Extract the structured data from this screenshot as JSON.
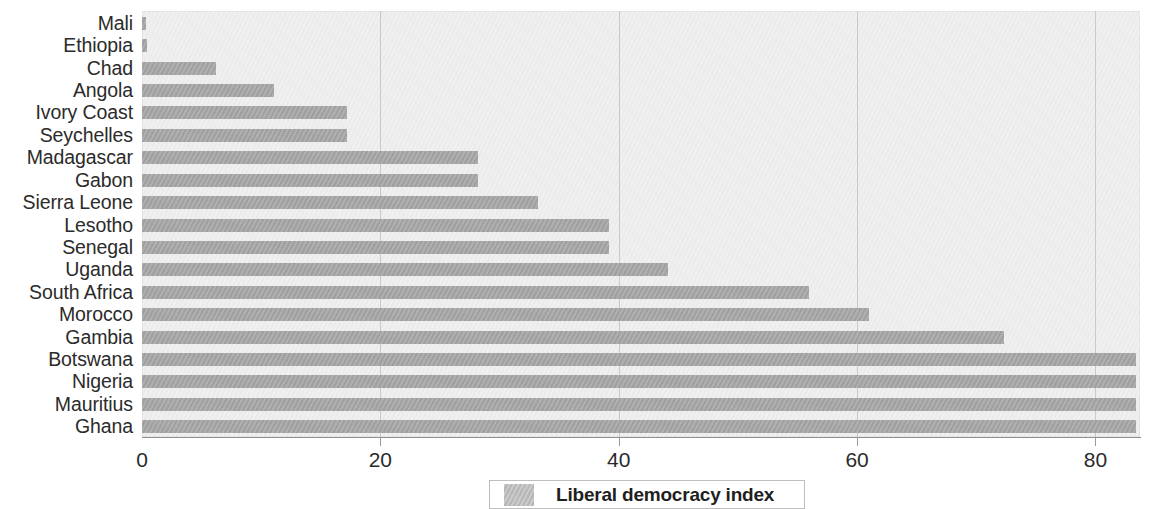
{
  "chart_data": {
    "type": "bar",
    "orientation": "horizontal",
    "title": "",
    "xlabel": "",
    "ylabel": "",
    "xlim": [
      0,
      83.7
    ],
    "xticks": [
      0,
      20,
      40,
      60,
      80
    ],
    "xtick_labels": [
      "0",
      "20",
      "40",
      "60",
      "80"
    ],
    "grid": true,
    "grid_axis": "x",
    "legend": {
      "position": "bottom-center",
      "entries": [
        {
          "name": "Liberal democracy index",
          "color": "#a6a6a6"
        }
      ]
    },
    "series": [
      {
        "name": "Liberal democracy index",
        "color": "#a6a6a6",
        "values": [
          0.3,
          0.4,
          6.2,
          11.1,
          17.2,
          17.2,
          28.2,
          28.2,
          33.2,
          39.2,
          39.2,
          44.1,
          56.0,
          61.0,
          72.3,
          83.4,
          83.4,
          83.4,
          83.4
        ]
      }
    ],
    "categories": [
      "Mali",
      "Ethiopia",
      "Chad",
      "Angola",
      "Ivory Coast",
      "Seychelles",
      "Madagascar",
      "Gabon",
      "Sierra Leone",
      "Lesotho",
      "Senegal",
      "Uganda",
      "South Africa",
      "Morocco",
      "Gambia",
      "Botswana",
      "Nigeria",
      "Mauritius",
      "Ghana"
    ],
    "points": [
      {
        "category": "Mali",
        "value": 0.3
      },
      {
        "category": "Ethiopia",
        "value": 0.4
      },
      {
        "category": "Chad",
        "value": 6.2
      },
      {
        "category": "Angola",
        "value": 11.1
      },
      {
        "category": "Ivory Coast",
        "value": 17.2
      },
      {
        "category": "Seychelles",
        "value": 17.2
      },
      {
        "category": "Madagascar",
        "value": 28.2
      },
      {
        "category": "Gabon",
        "value": 28.2
      },
      {
        "category": "Sierra Leone",
        "value": 33.2
      },
      {
        "category": "Lesotho",
        "value": 39.2
      },
      {
        "category": "Senegal",
        "value": 39.2
      },
      {
        "category": "Uganda",
        "value": 44.1
      },
      {
        "category": "South Africa",
        "value": 56.0
      },
      {
        "category": "Morocco",
        "value": 61.0
      },
      {
        "category": "Gambia",
        "value": 72.3
      },
      {
        "category": "Botswana",
        "value": 83.4
      },
      {
        "category": "Nigeria",
        "value": 83.4
      },
      {
        "category": "Mauritius",
        "value": 83.4
      },
      {
        "category": "Ghana",
        "value": 83.4
      }
    ]
  },
  "legend": {
    "label": "Liberal democracy index"
  },
  "colors": {
    "bar": "#a6a6a6",
    "plot_background": "#ededed",
    "gridline": "#c9c9c9",
    "axis": "#8f8f8f",
    "text": "#2b2b2b"
  }
}
